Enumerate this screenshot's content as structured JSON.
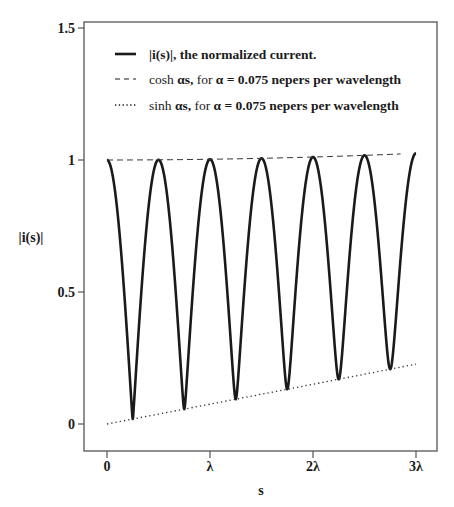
{
  "chart_data": {
    "type": "line",
    "title": "",
    "xlabel": "s",
    "ylabel": "|i(s)|",
    "xlim": [
      0,
      3
    ],
    "ylim": [
      -0.1,
      1.5
    ],
    "x_ticks": [
      {
        "value": 0,
        "label": "0"
      },
      {
        "value": 1,
        "label": "λ"
      },
      {
        "value": 2,
        "label": "2λ"
      },
      {
        "value": 3,
        "label": "3λ"
      }
    ],
    "y_ticks": [
      {
        "value": 0,
        "label": "0"
      },
      {
        "value": 0.5,
        "label": "0.5"
      },
      {
        "value": 1,
        "label": "1"
      },
      {
        "value": 1.5,
        "label": "1.5"
      }
    ],
    "grid": false,
    "legend_position": "upper-left-inside",
    "alpha_nepers_per_wavelength": 0.075,
    "series": [
      {
        "name": "|i(s)|, the normalized current.",
        "style": "solid-thick",
        "x": [
          0,
          0.25,
          0.5,
          0.75,
          1.0,
          1.25,
          1.5,
          1.75,
          2.0,
          2.25,
          2.5,
          2.75,
          3.0
        ],
        "values": [
          1.0,
          0.019,
          1.001,
          0.056,
          1.003,
          0.094,
          1.006,
          0.132,
          1.011,
          0.17,
          1.018,
          0.208,
          1.025
        ]
      },
      {
        "name": "cosh αs, for α = 0.075 nepers per wavelength",
        "style": "dashed",
        "x": [
          0,
          1,
          2,
          2.85
        ],
        "values": [
          1.0,
          1.003,
          1.011,
          1.023
        ]
      },
      {
        "name": "sinh αs, for α = 0.075 nepers per wavelength",
        "style": "dotted",
        "x": [
          0,
          1,
          2,
          3
        ],
        "values": [
          0.0,
          0.075,
          0.15,
          0.226
        ]
      }
    ]
  },
  "legend": {
    "items": [
      {
        "parts": [
          {
            "text": "|i(s)|, the normalized current.",
            "bold": true
          }
        ]
      },
      {
        "parts": [
          {
            "text": "cosh ",
            "bold": false
          },
          {
            "text": "αs,",
            "bold": true
          },
          {
            "text": " for ",
            "bold": false
          },
          {
            "text": "α = 0.075 nepers per wavelength",
            "bold": true
          }
        ]
      },
      {
        "parts": [
          {
            "text": "sinh ",
            "bold": false
          },
          {
            "text": "αs,",
            "bold": true
          },
          {
            "text": " for ",
            "bold": false
          },
          {
            "text": "α = 0.075 nepers per wavelength",
            "bold": true
          }
        ]
      }
    ]
  },
  "colors": {
    "line": "#1a1a1a",
    "frame": "#555555",
    "background": "#ffffff"
  }
}
